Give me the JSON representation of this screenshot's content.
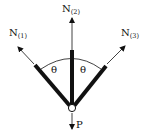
{
  "diagram": {
    "type": "force-diagram",
    "colors": {
      "ink": "#111111",
      "background": "#ffffff"
    },
    "forces": [
      {
        "id": "N1",
        "main": "N",
        "subscript": "(1)"
      },
      {
        "id": "N2",
        "main": "N",
        "subscript": "(2)"
      },
      {
        "id": "N3",
        "main": "N",
        "subscript": "(3)"
      },
      {
        "id": "P",
        "main": "P",
        "subscript": ""
      }
    ],
    "angles": [
      {
        "symbol": "θ"
      },
      {
        "symbol": "θ"
      }
    ]
  }
}
